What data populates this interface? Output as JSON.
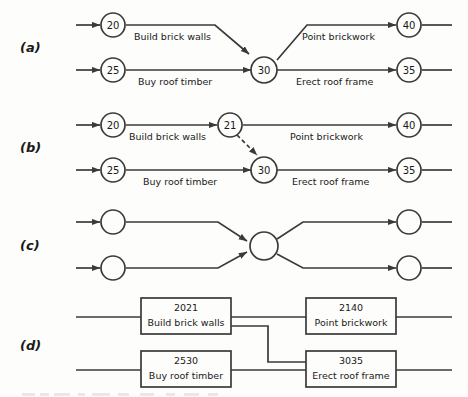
{
  "figure": {
    "background_color": "#fdfdfb",
    "line_color": "#3a3a3a",
    "panels": [
      {
        "label": "(a)",
        "style": "activity-on-arrow",
        "nodes": [
          {
            "id": "20",
            "label": "20"
          },
          {
            "id": "25",
            "label": "25"
          },
          {
            "id": "30",
            "label": "30"
          },
          {
            "id": "40",
            "label": "40"
          },
          {
            "id": "35",
            "label": "35"
          }
        ],
        "edges": [
          {
            "from": "20",
            "to": "30",
            "label": "Build brick walls",
            "style": "solid"
          },
          {
            "from": "25",
            "to": "30",
            "label": "Buy roof timber",
            "style": "solid"
          },
          {
            "from": "30",
            "to": "40",
            "label": "Point brickwork",
            "style": "solid"
          },
          {
            "from": "30",
            "to": "35",
            "label": "Erect roof frame",
            "style": "solid"
          }
        ]
      },
      {
        "label": "(b)",
        "style": "activity-on-arrow-with-dummy",
        "nodes": [
          {
            "id": "20",
            "label": "20"
          },
          {
            "id": "21",
            "label": "21"
          },
          {
            "id": "25",
            "label": "25"
          },
          {
            "id": "30",
            "label": "30"
          },
          {
            "id": "40",
            "label": "40"
          },
          {
            "id": "35",
            "label": "35"
          }
        ],
        "edges": [
          {
            "from": "20",
            "to": "21",
            "label": "Build brick walls",
            "style": "solid"
          },
          {
            "from": "21",
            "to": "40",
            "label": "Point brickwork",
            "style": "solid"
          },
          {
            "from": "21",
            "to": "30",
            "label": "",
            "style": "dashed"
          },
          {
            "from": "25",
            "to": "30",
            "label": "Buy roof timber",
            "style": "solid"
          },
          {
            "from": "30",
            "to": "35",
            "label": "Erect roof frame",
            "style": "solid"
          }
        ]
      },
      {
        "label": "(c)",
        "style": "unlabelled-merge-burst",
        "nodes": [
          {
            "id": "top-left",
            "label": ""
          },
          {
            "id": "bottom-left",
            "label": ""
          },
          {
            "id": "centre",
            "label": ""
          },
          {
            "id": "top-right",
            "label": ""
          },
          {
            "id": "bottom-right",
            "label": ""
          }
        ],
        "edges": [
          {
            "from": "top-left",
            "to": "centre",
            "label": "",
            "style": "solid"
          },
          {
            "from": "bottom-left",
            "to": "centre",
            "label": "",
            "style": "solid"
          },
          {
            "from": "centre",
            "to": "top-right",
            "label": "",
            "style": "solid"
          },
          {
            "from": "centre",
            "to": "bottom-right",
            "label": "",
            "style": "solid"
          }
        ]
      },
      {
        "label": "(d)",
        "style": "activity-on-node",
        "boxes": [
          {
            "id": "2021",
            "number": "2021",
            "task": "Build brick walls",
            "position": "top-left"
          },
          {
            "id": "2140",
            "number": "2140",
            "task": "Point brickwork",
            "position": "top-right"
          },
          {
            "id": "2530",
            "number": "2530",
            "task": "Buy roof timber",
            "position": "bottom-left"
          },
          {
            "id": "3035",
            "number": "3035",
            "task": "Erect roof frame",
            "position": "bottom-right"
          }
        ],
        "connectors": [
          {
            "from": "2021",
            "to": "2140",
            "style": "straight"
          },
          {
            "from": "2021",
            "to": "3035",
            "style": "stepped"
          },
          {
            "from": "2530",
            "to": "3035",
            "style": "straight"
          }
        ]
      }
    ]
  }
}
